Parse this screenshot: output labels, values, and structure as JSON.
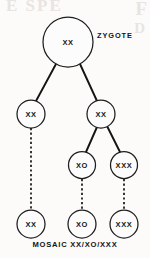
{
  "figure": {
    "type": "lineage-tree",
    "width": 150,
    "height": 258,
    "background_color": "#fcfbfa",
    "ink_color": "#141414"
  },
  "labels": {
    "zygote": "ZYGOTE",
    "caption": "MOSAIC  XX/XO/XXX"
  },
  "ghost_text": {
    "a": "E SPE",
    "b": "F",
    "c": "D"
  },
  "nodes": [
    {
      "id": "zygote",
      "label": "XX",
      "cx": 68,
      "cy": 42,
      "r": 25,
      "row": 0
    },
    {
      "id": "gen1-left",
      "label": "XX",
      "cx": 31,
      "cy": 114,
      "r": 14,
      "row": 1
    },
    {
      "id": "gen1-right",
      "label": "XX",
      "cx": 101,
      "cy": 114,
      "r": 14,
      "row": 1
    },
    {
      "id": "gen2-xo",
      "label": "XO",
      "cx": 82,
      "cy": 165,
      "r": 13.5,
      "row": 2
    },
    {
      "id": "gen2-xxx",
      "label": "XXX",
      "cx": 124,
      "cy": 165,
      "r": 13.5,
      "row": 2
    },
    {
      "id": "gen3-xx",
      "label": "XX",
      "cx": 31,
      "cy": 224,
      "r": 14,
      "row": 3
    },
    {
      "id": "gen3-xo",
      "label": "XO",
      "cx": 82,
      "cy": 224,
      "r": 14,
      "row": 3
    },
    {
      "id": "gen3-xxx",
      "label": "XXX",
      "cx": 124,
      "cy": 224,
      "r": 14,
      "row": 3
    }
  ],
  "edges": [
    {
      "id": "zygote-to-left",
      "from": "zygote",
      "to": "gen1-left",
      "style": "solid",
      "x1": 56,
      "y1": 64,
      "x2": 36,
      "y2": 101
    },
    {
      "id": "zygote-to-right",
      "from": "zygote",
      "to": "gen1-right",
      "style": "solid",
      "x1": 80,
      "y1": 64,
      "x2": 97,
      "y2": 101
    },
    {
      "id": "right-to-xo",
      "from": "gen1-right",
      "to": "gen2-xo",
      "style": "solid",
      "x1": 97,
      "y1": 127,
      "x2": 86,
      "y2": 152
    },
    {
      "id": "right-to-xxx",
      "from": "gen1-right",
      "to": "gen2-xxx",
      "style": "solid",
      "x1": 107,
      "y1": 126,
      "x2": 120,
      "y2": 152
    },
    {
      "id": "left-to-bottom",
      "from": "gen1-left",
      "to": "gen3-xx",
      "style": "dashed",
      "x1": 31,
      "y1": 128,
      "x2": 31,
      "y2": 210
    },
    {
      "id": "xo-to-bottom",
      "from": "gen2-xo",
      "to": "gen3-xo",
      "style": "dashed",
      "x1": 82,
      "y1": 179,
      "x2": 82,
      "y2": 210
    },
    {
      "id": "xxx-to-bottom",
      "from": "gen2-xxx",
      "to": "gen3-xxx",
      "style": "dashed",
      "x1": 124,
      "y1": 179,
      "x2": 124,
      "y2": 210
    }
  ]
}
